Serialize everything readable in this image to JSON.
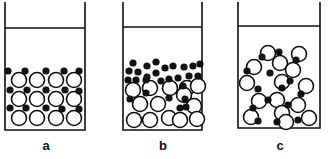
{
  "figure": {
    "labels": [
      "a",
      "b",
      "c"
    ],
    "colors": {
      "stroke": "#111111",
      "filled": "#111111",
      "open": "#ffffff"
    },
    "panels": [
      {
        "id": "a",
        "description": "Ordered lattice of large open circles with small filled circles in interstitial positions",
        "beaker": {
          "x1": 5,
          "x2": 85,
          "top": 2,
          "liquid_y": 28,
          "bottom": 130
        }
      },
      {
        "id": "b",
        "description": "Small filled circles segregated to top layer, large open circles at bottom",
        "beaker": {
          "x1": 123,
          "x2": 202,
          "top": 2,
          "liquid_y": 27,
          "bottom": 130
        }
      },
      {
        "id": "c",
        "description": "Large open circles and small filled circles bonded in chain-like clusters",
        "beaker": {
          "x1": 238,
          "x2": 320,
          "top": 2,
          "liquid_y": 26,
          "bottom": 128
        }
      }
    ]
  }
}
